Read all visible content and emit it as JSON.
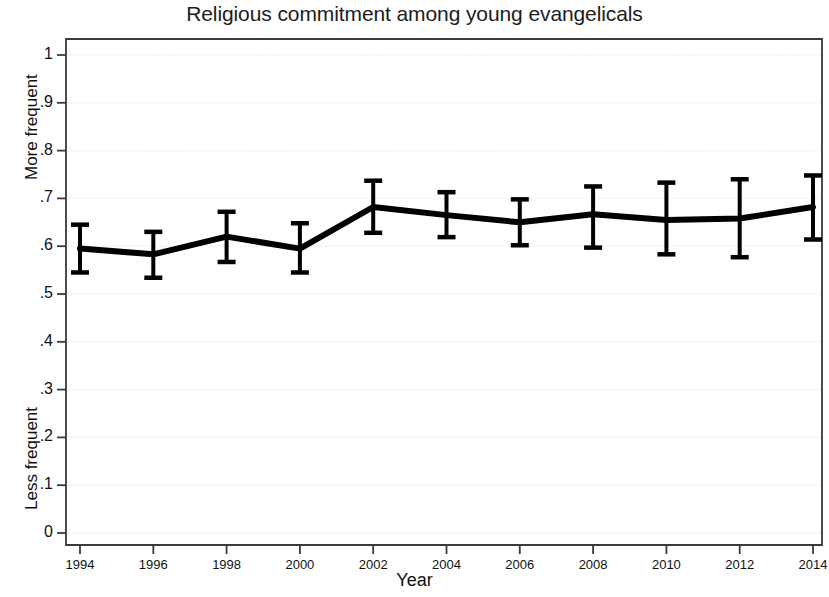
{
  "chart_data": {
    "type": "line",
    "title": "Religious commitment among young evangelicals",
    "xlabel": "Year",
    "ylabel": "",
    "y_axis_low_caption": "Less frequent",
    "y_axis_high_caption": "More frequent",
    "grid": true,
    "legend": "none",
    "xlim": [
      1993,
      2015
    ],
    "ylim": [
      0,
      1
    ],
    "x": [
      1994,
      1996,
      1998,
      2000,
      2002,
      2004,
      2006,
      2008,
      2010,
      2012,
      2014
    ],
    "xtick_labels": [
      "1994",
      "1996",
      "1998",
      "2000",
      "2002",
      "2004",
      "2006",
      "2008",
      "2010",
      "2012",
      "2014"
    ],
    "ytick_values": [
      0,
      0.1,
      0.2,
      0.3,
      0.4,
      0.5,
      0.6,
      0.7,
      0.8,
      0.9,
      1
    ],
    "ytick_labels": [
      "0",
      ".1",
      ".2",
      ".3",
      ".4",
      ".5",
      ".6",
      ".7",
      ".8",
      ".9",
      "1"
    ],
    "series": [
      {
        "name": "Religious commitment",
        "values": [
          0.595,
          0.583,
          0.62,
          0.595,
          0.682,
          0.665,
          0.65,
          0.667,
          0.655,
          0.658,
          0.682
        ],
        "error_low": [
          0.545,
          0.534,
          0.567,
          0.545,
          0.628,
          0.619,
          0.602,
          0.597,
          0.583,
          0.577,
          0.614
        ],
        "error_high": [
          0.645,
          0.63,
          0.672,
          0.648,
          0.737,
          0.713,
          0.698,
          0.725,
          0.733,
          0.74,
          0.748
        ],
        "color": "#000000",
        "line_width": 6,
        "error_bar_style": "capped"
      }
    ],
    "colors": {
      "line": "#000000",
      "error_bar": "#000000",
      "grid": "#e8e8e8",
      "axis": "#3a3a3a",
      "background": "#ffffff",
      "text": "#111111"
    }
  }
}
